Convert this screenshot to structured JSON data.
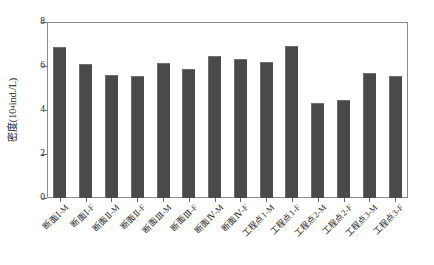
{
  "chart_data": {
    "type": "bar",
    "title": "",
    "subtitle": "",
    "xlabel": "",
    "ylabel_text": "密度(10",
    "ylabel_sup": "4",
    "ylabel_tail": "ind./L)",
    "ylabel_full": "密度(10⁴ind./L)",
    "ylim": [
      0,
      8
    ],
    "yticks": [
      "0",
      "2",
      "4",
      "6",
      "8"
    ],
    "ytick_values": [
      0,
      2,
      4,
      6,
      8
    ],
    "grid": false,
    "legend": "none",
    "bar_color": "#4a4a4a",
    "frame_color": "#8a8a8a",
    "categories": [
      "断面Ⅰ-M",
      "断面Ⅰ-F",
      "断面Ⅱ-M",
      "断面Ⅱ-F",
      "断面Ⅲ-M",
      "断面Ⅲ-F",
      "断面Ⅳ-M",
      "断面Ⅳ-F",
      "工程点1-M",
      "工程点1-F",
      "工程点2-M",
      "工程点2-F",
      "工程点3-M",
      "工程点3-F"
    ],
    "values": [
      6.85,
      6.1,
      5.6,
      5.55,
      6.15,
      5.85,
      6.45,
      6.3,
      6.2,
      6.9,
      4.3,
      4.45,
      5.7,
      5.55
    ]
  }
}
